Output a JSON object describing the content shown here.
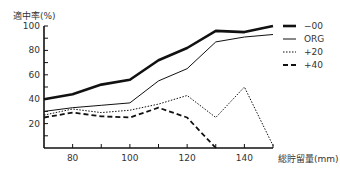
{
  "chart_data": {
    "type": "line",
    "title": "",
    "ylabel": "適中率(%)",
    "xlabel": "総貯留量(mm)",
    "x": [
      70,
      80,
      90,
      100,
      110,
      120,
      130,
      140,
      150
    ],
    "xticks": [
      80,
      100,
      120,
      140
    ],
    "yticks": [
      20,
      40,
      60,
      80,
      100
    ],
    "xlim": [
      70,
      150
    ],
    "ylim": [
      0,
      100
    ],
    "grid": false,
    "legend_position": "upper right, outside plot",
    "series": [
      {
        "name": "−00",
        "style": "thick-solid",
        "values": [
          40,
          44,
          52,
          56,
          72,
          82,
          96,
          95,
          100
        ]
      },
      {
        "name": "ORG",
        "style": "thin-solid",
        "values": [
          30,
          33,
          35,
          37,
          55,
          65,
          87,
          91,
          93
        ]
      },
      {
        "name": "+20",
        "style": "dotted",
        "values": [
          27,
          32,
          29,
          31,
          36,
          43,
          25,
          50,
          2
        ]
      },
      {
        "name": "+40",
        "style": "dashed",
        "values": [
          25,
          29,
          26,
          25,
          33,
          25,
          0,
          null,
          null
        ]
      }
    ]
  }
}
